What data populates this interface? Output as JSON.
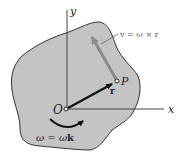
{
  "diagram": {
    "labels": {
      "x_axis": "x",
      "y_axis": "y",
      "origin": "O",
      "point": "P",
      "position_vector": "r",
      "velocity_eq": "v = ω × r",
      "angular_velocity_eq_lhs": "ω = ω",
      "angular_velocity_eq_k": "k"
    },
    "colors": {
      "body_fill": "#c4c4c4",
      "body_outline": "#333333",
      "axis": "#444444",
      "position_vector": "#111111",
      "velocity_vector": "#8a8a8a",
      "background": "#ffffff"
    }
  }
}
